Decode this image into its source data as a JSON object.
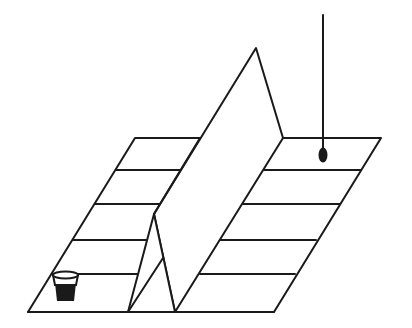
{
  "figure": {
    "colors": {
      "line": "#1a1a1a",
      "background": "#ffffff"
    },
    "board": {
      "corners": [
        [
          135,
          138
        ],
        [
          381,
          138
        ],
        [
          274,
          312
        ],
        [
          28,
          312
        ]
      ],
      "rungs_left_y": [
        170,
        204,
        240,
        274
      ],
      "rungs_right_y": [
        170,
        204,
        240,
        274
      ]
    },
    "divider": {
      "ridge_front": [
        154,
        214
      ],
      "ridge_back": [
        256,
        48
      ],
      "base_front_left": [
        128,
        312
      ],
      "base_front_right": [
        175,
        312
      ],
      "base_back_right": [
        283,
        138
      ]
    },
    "objects": [
      {
        "name": "cup",
        "icon": "cup-icon",
        "position": [
          65,
          285
        ]
      },
      {
        "name": "pendulum",
        "icon": "pendulum-icon",
        "position": [
          323,
          155
        ]
      }
    ]
  }
}
